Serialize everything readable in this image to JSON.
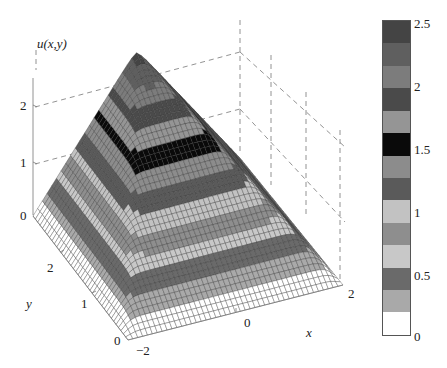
{
  "chart_data": {
    "type": "surface",
    "title": "",
    "zlabel": "u(x,y)",
    "xlabel": "x",
    "ylabel": "y",
    "x_range": [
      -2,
      2
    ],
    "y_range": [
      0,
      3
    ],
    "z_range": [
      0,
      2.5
    ],
    "x_ticks": [
      "-2",
      "0",
      "2"
    ],
    "y_ticks": [
      "0",
      "1",
      "2"
    ],
    "z_ticks": [
      "0",
      "1",
      "2"
    ],
    "grid": "dashed back-plane lines at z = 1, 2",
    "peak_value": 2.5,
    "colorbar": {
      "ticks": [
        "0",
        "0.5",
        "1",
        "1.5",
        "2",
        "2.5"
      ],
      "range": [
        0,
        2.5
      ],
      "levels": 13,
      "band_colors_bottom_to_top": [
        "#ffffff",
        "#a9a9a9",
        "#6a6a6a",
        "#c8c8c8",
        "#8e8e8e",
        "#c2c2c2",
        "#5a5a5a",
        "#8c8c8c",
        "#0a0a0a",
        "#959595",
        "#4a4a4a",
        "#7c7c7c",
        "#5f5f5f",
        "#444444"
      ]
    }
  },
  "labels": {
    "zlabel": "u(x,y)",
    "xlabel": "x",
    "ylabel": "y",
    "z_tick_0": "0",
    "z_tick_1": "1",
    "z_tick_2": "2",
    "y_tick_0": "0",
    "y_tick_1": "1",
    "y_tick_2": "2",
    "x_tick_m2": "−2",
    "x_tick_0": "0",
    "x_tick_2": "2",
    "cb_0": "0",
    "cb_05": "0.5",
    "cb_1": "1",
    "cb_15": "1.5",
    "cb_2": "2",
    "cb_25": "2.5"
  }
}
